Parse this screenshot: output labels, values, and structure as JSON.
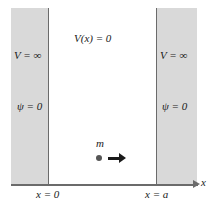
{
  "figure": {
    "colors": {
      "wall_fill": "#d9d9d9",
      "wall_border": "#6b6b6b",
      "axis": "#6b6b6b",
      "text": "#1a1a1a",
      "particle": "#555555",
      "background": "#ffffff"
    }
  },
  "regions": {
    "left_wall": {
      "potential_label": "V = ∞",
      "wavefunction_label": "ψ = 0"
    },
    "right_wall": {
      "potential_label": "V = ∞",
      "wavefunction_label": "ψ = 0"
    },
    "well_interior": {
      "potential_label": "V(x) = 0"
    }
  },
  "particle": {
    "mass_label": "m",
    "direction_icon": "right-arrow-icon"
  },
  "axis": {
    "name": "x",
    "arrow_icon": "right-arrow-icon",
    "ticks": [
      {
        "label": "x = 0"
      },
      {
        "label": "x = a"
      }
    ]
  }
}
